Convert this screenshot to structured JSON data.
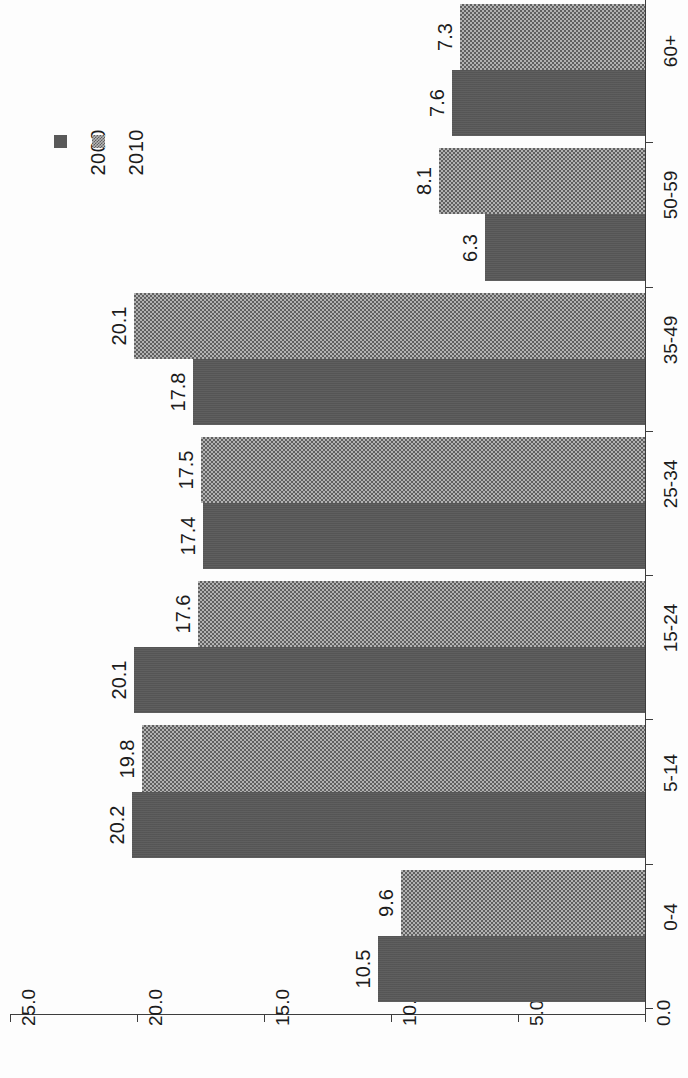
{
  "chart_data": {
    "type": "bar",
    "orientation": "horizontal-rotated",
    "title": "",
    "xlabel": "",
    "ylabel": "",
    "categories": [
      "0-4",
      "5-14",
      "15-24",
      "25-34",
      "35-49",
      "50-59",
      "60+"
    ],
    "tick_labels": [
      "25.0",
      "20.0",
      "15.0",
      "10.0",
      "5.0",
      "0.0"
    ],
    "tick_values": [
      25.0,
      20.0,
      15.0,
      10.0,
      5.0,
      0.0
    ],
    "ylim": [
      0.0,
      25.0
    ],
    "grid": false,
    "legend_position": "top-left",
    "series": [
      {
        "name": "2000",
        "swatch": "solid",
        "color": "#585858",
        "values": [
          10.5,
          20.2,
          20.1,
          17.4,
          17.8,
          6.3,
          7.6
        ],
        "labels": [
          "10.5",
          "20.2",
          "20.1",
          "17.4",
          "17.8",
          "6.3",
          "7.6"
        ]
      },
      {
        "name": "2010",
        "swatch": "checker",
        "color": "#b2b2b2",
        "values": [
          9.6,
          19.8,
          17.6,
          17.5,
          20.1,
          8.1,
          7.3
        ],
        "labels": [
          "9.6",
          "19.8",
          "17.6",
          "17.5",
          "20.1",
          "8.1",
          "7.3"
        ]
      }
    ]
  },
  "legend": {
    "entries": [
      {
        "label": "2000"
      },
      {
        "label": "2010"
      }
    ]
  }
}
